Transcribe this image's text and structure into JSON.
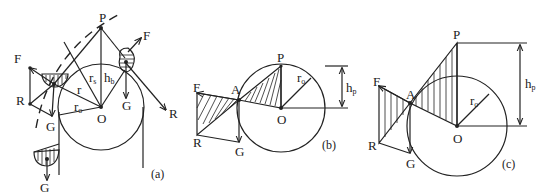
{
  "figure": {
    "panels": [
      {
        "id": "a",
        "caption": "(a)",
        "labels": {
          "P": "P",
          "O": "O",
          "F_top": "F",
          "F_left": "F",
          "R_left": "R",
          "R_right": "R",
          "G_mid": "G",
          "G_right": "G",
          "G_bottom": "G",
          "r": "r",
          "r_sub": "",
          "r1": "r",
          "r1_sub": "s",
          "r2": "r",
          "r2_sub": "o",
          "h": "h",
          "h_sub": "b"
        }
      },
      {
        "id": "b",
        "caption": "(b)",
        "labels": {
          "P": "P",
          "O": "O",
          "A": "A",
          "F": "F",
          "R": "R",
          "G": "G",
          "r": "r",
          "r_sub": "o",
          "h": "h",
          "h_sub": "p"
        }
      },
      {
        "id": "c",
        "caption": "(c)",
        "labels": {
          "P": "P",
          "O": "O",
          "A": "A",
          "F": "F",
          "R": "R",
          "G": "G",
          "r": "r",
          "r_sub": "o",
          "h": "h",
          "h_sub": "p"
        }
      }
    ],
    "colors": {
      "ink": "#222222",
      "background": "#ffffff"
    }
  }
}
